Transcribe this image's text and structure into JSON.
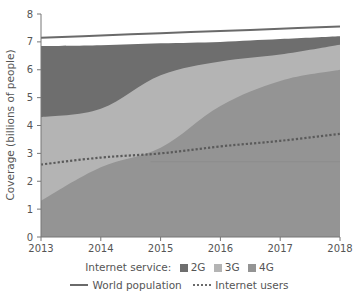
{
  "chart_data": {
    "type": "area",
    "title": "",
    "xlabel": "",
    "ylabel": "Coverage (billions of people)",
    "x": [
      2013,
      2014,
      2015,
      2016,
      2017,
      2018
    ],
    "xticks": [
      "2013",
      "2014",
      "2015",
      "2016",
      "2017",
      "2018"
    ],
    "yticks": [
      "0",
      "1",
      "2",
      "3",
      "4",
      "5",
      "6",
      "7",
      "8"
    ],
    "ylim": [
      0,
      8
    ],
    "xlim": [
      2013,
      2018
    ],
    "grid": false,
    "stacked_cumulative": true,
    "series": [
      {
        "name": "2G",
        "kind": "area",
        "color": "#6e6e6e",
        "values": [
          6.85,
          6.88,
          6.95,
          7.0,
          7.1,
          7.2
        ]
      },
      {
        "name": "3G",
        "kind": "area",
        "color": "#b4b4b4",
        "values": [
          4.3,
          4.6,
          5.8,
          6.3,
          6.55,
          6.9
        ]
      },
      {
        "name": "4G",
        "kind": "area",
        "color": "#949494",
        "values": [
          1.3,
          2.5,
          3.2,
          4.7,
          5.6,
          6.0
        ]
      },
      {
        "name": "World population",
        "kind": "line",
        "style": "solid",
        "color": "#6a6a6a",
        "values": [
          7.15,
          7.23,
          7.31,
          7.39,
          7.47,
          7.55
        ]
      },
      {
        "name": "Internet users",
        "kind": "line",
        "style": "dotted",
        "color": "#5a5a5a",
        "values": [
          2.6,
          2.85,
          3.0,
          3.25,
          3.45,
          3.7
        ]
      }
    ],
    "annotations": [
      {
        "kind": "hline",
        "y": 2.7,
        "x_from": 2015,
        "x_to": 2018,
        "color": "#8a8a8a"
      }
    ],
    "legend": {
      "position": "bottom",
      "row1_title": "Internet service:",
      "row1_items": [
        "2G",
        "3G",
        "4G"
      ],
      "row2_items": [
        "World population",
        "Internet users"
      ]
    }
  },
  "legend": {
    "service_title": "Internet service:",
    "g2": "2G",
    "g3": "3G",
    "g4": "4G",
    "world": "World population",
    "users": "Internet users"
  },
  "axis": {
    "ylabel": "Coverage (billions of people)"
  }
}
